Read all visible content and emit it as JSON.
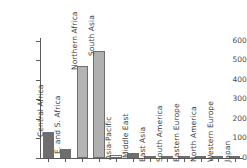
{
  "chart_data": {
    "type": "bar",
    "title": "",
    "subtitle": "",
    "xlabel": "",
    "ylabel": "",
    "ylim": [
      0,
      620
    ],
    "yticks": [
      0,
      100,
      200,
      300,
      400,
      500,
      600
    ],
    "ytick_labels": [
      "0",
      "100",
      "200",
      "300",
      "400",
      "500",
      "600"
    ],
    "grid": false,
    "legend": false,
    "categories": [
      "Central Africa",
      "E. and S. Africa",
      "Northern Africa",
      "South Asia",
      "Asia-Pacific",
      "Middle East",
      "East Asia",
      "South America",
      "Eastern Europe",
      "North America",
      "Western Europe",
      "Japan"
    ],
    "values": [
      133,
      46,
      474,
      548,
      17,
      28,
      2,
      1,
      1,
      1,
      1,
      1
    ],
    "bar_colors": [
      "#6e6e6e",
      "#6e6e6e",
      "#b5b5b5",
      "#b0b0b0",
      "#fdfdfd",
      "#6e6e6e",
      "#8a8a8a",
      "#8a8a8a",
      "#8a8a8a",
      "#8a8a8a",
      "#8a8a8a",
      "#8a8a8a"
    ]
  },
  "colors": {
    "axis": "#5a5a5a",
    "text": "#3d3d3d",
    "tick_text": "#4a4a4a",
    "background": "#ffffff",
    "bar_dark": "#6e6e6e",
    "bar_light": "#b5b5b5",
    "bar_white": "#fdfdfd",
    "bar_edge": "#6e6e6e"
  }
}
